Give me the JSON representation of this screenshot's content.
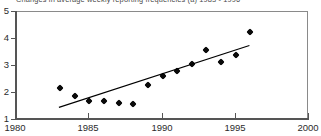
{
  "chart_data": {
    "type": "scatter",
    "title": "Changes in average weekly reporting frequencies (a) 1983 - 1996",
    "xlabel": "",
    "ylabel": "",
    "xlim": [
      1980,
      2000
    ],
    "ylim": [
      1,
      5
    ],
    "xticks": [
      1980,
      1985,
      1990,
      1995,
      2000
    ],
    "xtick_labels": [
      "1980",
      "1985",
      "1990",
      "1995",
      "2000"
    ],
    "yticks": [
      1,
      2,
      3,
      4,
      5
    ],
    "ytick_labels": [
      "1",
      "2",
      "3",
      "4",
      "5"
    ],
    "grid": false,
    "legend": false,
    "marker": "diamond",
    "marker_color": "#0a0a0a",
    "line_color": "#000000",
    "x": [
      1983,
      1984,
      1985,
      1986,
      1987,
      1988,
      1989,
      1990,
      1991,
      1992,
      1993,
      1994,
      1995,
      1996
    ],
    "values": [
      2.2,
      1.88,
      1.72,
      1.71,
      1.62,
      1.58,
      2.3,
      2.63,
      2.8,
      3.09,
      3.6,
      3.15,
      3.39,
      4.25
    ],
    "series": [
      {
        "name": "Average weekly reporting frequency",
        "type": "scatter",
        "x": [
          1983,
          1984,
          1985,
          1986,
          1987,
          1988,
          1989,
          1990,
          1991,
          1992,
          1993,
          1994,
          1995,
          1996
        ],
        "values": [
          2.2,
          1.88,
          1.72,
          1.71,
          1.62,
          1.58,
          2.3,
          2.63,
          2.8,
          3.09,
          3.6,
          3.15,
          3.39,
          4.25
        ]
      },
      {
        "name": "Linear trend",
        "type": "line",
        "x": [
          1983,
          1996
        ],
        "values": [
          1.43,
          3.72
        ]
      }
    ],
    "annotations": []
  }
}
